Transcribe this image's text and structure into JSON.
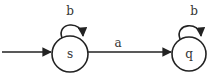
{
  "diagram": {
    "type": "finite-automaton",
    "states": [
      {
        "id": "s",
        "label": "s",
        "start": true,
        "accepting": false
      },
      {
        "id": "q",
        "label": "q",
        "start": false,
        "accepting": false
      }
    ],
    "transitions": [
      {
        "from": "s",
        "to": "s",
        "label": "b"
      },
      {
        "from": "s",
        "to": "q",
        "label": "a"
      },
      {
        "from": "q",
        "to": "q",
        "label": "b"
      }
    ],
    "colors": {
      "stroke": "#222222",
      "text": "#333333",
      "background": "#ffffff"
    }
  }
}
